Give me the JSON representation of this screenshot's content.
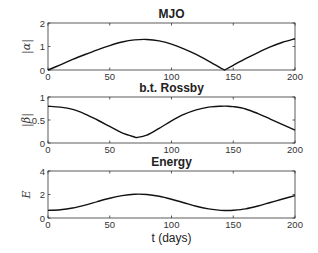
{
  "chart_data": [
    {
      "type": "line",
      "title": "MJO",
      "xlabel": "",
      "ylabel": "|α|",
      "xlim": [
        0,
        200
      ],
      "ylim": [
        0,
        2
      ],
      "xticks": [
        0,
        50,
        100,
        150,
        200
      ],
      "yticks": [
        0,
        1,
        2
      ],
      "grid": false,
      "x": [
        0,
        10,
        20,
        30,
        40,
        50,
        60,
        70,
        80,
        90,
        100,
        110,
        120,
        130,
        140,
        143,
        150,
        160,
        170,
        180,
        190,
        200
      ],
      "series": [
        {
          "name": "|α|",
          "values": [
            0.0,
            0.22,
            0.45,
            0.66,
            0.86,
            1.04,
            1.19,
            1.28,
            1.3,
            1.24,
            1.1,
            0.9,
            0.66,
            0.38,
            0.08,
            0.0,
            0.2,
            0.48,
            0.74,
            0.98,
            1.18,
            1.33
          ]
        }
      ]
    },
    {
      "type": "line",
      "title": "b.t. Rossby",
      "xlabel": "",
      "ylabel": "|β|",
      "xlim": [
        0,
        200
      ],
      "ylim": [
        0,
        1
      ],
      "xticks": [
        0,
        50,
        100,
        150,
        200
      ],
      "yticks": [
        0,
        0.5,
        1
      ],
      "grid": false,
      "x": [
        0,
        10,
        20,
        30,
        40,
        50,
        60,
        70,
        72,
        80,
        90,
        100,
        110,
        120,
        130,
        140,
        145,
        150,
        160,
        170,
        180,
        190,
        200
      ],
      "series": [
        {
          "name": "|β|",
          "values": [
            0.8,
            0.78,
            0.73,
            0.63,
            0.5,
            0.36,
            0.22,
            0.13,
            0.12,
            0.17,
            0.32,
            0.48,
            0.62,
            0.72,
            0.78,
            0.8,
            0.8,
            0.79,
            0.74,
            0.64,
            0.52,
            0.4,
            0.28
          ]
        }
      ]
    },
    {
      "type": "line",
      "title": "Energy",
      "xlabel": "t (days)",
      "ylabel": "E",
      "xlim": [
        0,
        200
      ],
      "ylim": [
        0,
        4
      ],
      "xticks": [
        0,
        50,
        100,
        150,
        200
      ],
      "yticks": [
        0,
        2,
        4
      ],
      "grid": false,
      "x": [
        0,
        10,
        20,
        30,
        40,
        50,
        60,
        70,
        80,
        90,
        100,
        110,
        120,
        130,
        140,
        145,
        150,
        160,
        170,
        180,
        190,
        200
      ],
      "series": [
        {
          "name": "E",
          "values": [
            0.65,
            0.7,
            0.85,
            1.1,
            1.4,
            1.68,
            1.9,
            2.02,
            2.0,
            1.85,
            1.6,
            1.3,
            1.0,
            0.78,
            0.65,
            0.64,
            0.66,
            0.78,
            1.02,
            1.32,
            1.62,
            1.9
          ]
        }
      ]
    }
  ]
}
